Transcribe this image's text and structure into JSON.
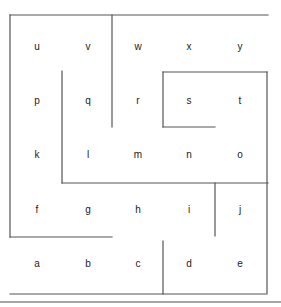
{
  "diagram": {
    "type": "maze-grid",
    "rows": [
      [
        "u",
        "v",
        "w",
        "x",
        "y"
      ],
      [
        "p",
        "q",
        "r",
        "s",
        "t"
      ],
      [
        "k",
        "l",
        "m",
        "n",
        "o"
      ],
      [
        "f",
        "g",
        "h",
        "i",
        "j"
      ],
      [
        "a",
        "b",
        "c",
        "d",
        "e"
      ]
    ],
    "colors": {
      "wall": "#555555",
      "label": "#222222",
      "rule": "#888888",
      "background": "#ffffff"
    }
  }
}
